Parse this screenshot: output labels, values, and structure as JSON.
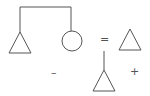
{
  "diagram": {
    "stroke_color": "#555555",
    "background": "#ffffff",
    "symbols": {
      "equals": "=",
      "minus": "–",
      "plus": "+"
    },
    "shapes": [
      {
        "id": "left-triangle",
        "type": "triangle"
      },
      {
        "id": "circle",
        "type": "circle"
      },
      {
        "id": "right-triangle",
        "type": "triangle"
      },
      {
        "id": "bottom-triangle",
        "type": "triangle"
      }
    ]
  }
}
